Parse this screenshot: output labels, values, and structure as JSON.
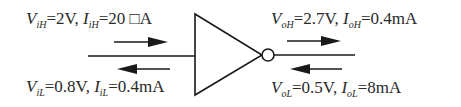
{
  "diagram": {
    "type": "logic-gate",
    "gate": "inverter",
    "colors": {
      "stroke": "#1a1a1a",
      "text": "#2a2a2a",
      "background": "#ffffff"
    },
    "input_high": {
      "v_symbol": "V",
      "v_sub": "iH",
      "v_value": "=2V,",
      "i_symbol": "I",
      "i_sub": "iH",
      "i_value": "=20 □A"
    },
    "input_low": {
      "v_symbol": "V",
      "v_sub": "iL",
      "v_value": "=0.8V,",
      "i_symbol": "I",
      "i_sub": "iL",
      "i_value": "=0.4mA"
    },
    "output_high": {
      "v_symbol": "V",
      "v_sub": "oH",
      "v_value": "=2.7V,",
      "i_symbol": "I",
      "i_sub": "oH",
      "i_value": "=0.4mA"
    },
    "output_low": {
      "v_symbol": "V",
      "v_sub": "oL",
      "v_value": "=0.5V,",
      "i_symbol": "I",
      "i_sub": "oL",
      "i_value": "=8mA"
    },
    "arrows": [
      {
        "side": "input",
        "direction": "right"
      },
      {
        "side": "input",
        "direction": "left"
      },
      {
        "side": "output",
        "direction": "right"
      },
      {
        "side": "output",
        "direction": "left"
      }
    ]
  }
}
